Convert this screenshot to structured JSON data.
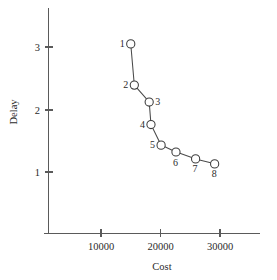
{
  "chart_data": {
    "type": "line",
    "title": "",
    "xlabel": "Cost",
    "ylabel": "Delay",
    "xlim": [
      4000,
      33500
    ],
    "ylim": [
      0.45,
      3.4
    ],
    "grid": false,
    "legend": null,
    "xticks": [
      10000,
      20000,
      30000
    ],
    "xtick_labels": [
      "10000",
      "20000",
      "30000"
    ],
    "yticks": [
      1,
      2,
      3
    ],
    "ytick_labels": [
      "1",
      "2",
      "3"
    ],
    "marker": "open-circle",
    "series": [
      {
        "name": "cost-delay-tradeoff",
        "x": [
          15000,
          15600,
          18100,
          18400,
          20100,
          22600,
          25900,
          29100
        ],
        "y": [
          3.05,
          2.39,
          2.12,
          1.76,
          1.43,
          1.32,
          1.21,
          1.13
        ],
        "point_labels": [
          "1",
          "2",
          "3",
          "4",
          "5",
          "6",
          "7",
          "8"
        ],
        "label_positions": [
          "left",
          "left",
          "right",
          "left",
          "left",
          "below",
          "below",
          "below"
        ]
      }
    ]
  },
  "axes": {
    "x_title": "Cost",
    "y_title": "Delay"
  }
}
